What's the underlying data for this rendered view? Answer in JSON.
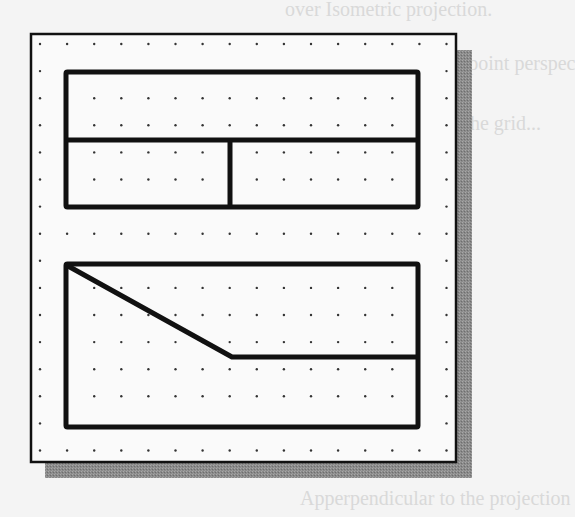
{
  "figure": {
    "background_color": "#f4f4f4",
    "sheet_color": "#fafafa",
    "line_color": "#111111",
    "shadow_color": "#8a8a8a",
    "grid": {
      "spacing_px": 27.1,
      "origin": [
        40,
        44
      ],
      "columns": 16,
      "rows": 16,
      "dot_color": "#333333"
    },
    "top_view": {
      "label": "Top rectangle divided into three regions",
      "outer": {
        "x": 66,
        "y": 72,
        "w": 352,
        "h": 135
      },
      "horizontal_divider_y": 140,
      "vertical_divider_x": 230
    },
    "front_view": {
      "label": "Bottom rectangle with inclined edge",
      "outer": {
        "x": 66,
        "y": 264,
        "w": 352,
        "h": 163
      },
      "inclined_edge": {
        "from": [
          68,
          266
        ],
        "to": [
          232,
          357
        ]
      },
      "horizontal_edge": {
        "from": [
          232,
          357
        ],
        "to": [
          418,
          357
        ]
      }
    }
  },
  "background_bleed": {
    "lines": [
      "over Isometric projection.",
      "ctive and a two-point perspec",
      "e geometry on the grid...",
      "Apperpendicular to the projection"
    ]
  }
}
